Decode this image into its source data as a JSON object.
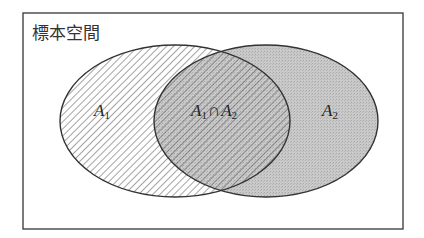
{
  "diagram": {
    "type": "venn",
    "sample_space_label": "標本空間",
    "sets": [
      {
        "name": "A",
        "subscript": "1",
        "fill": "hatched"
      },
      {
        "name": "A",
        "subscript": "2",
        "fill": "#c4c4c4"
      }
    ],
    "intersection": {
      "left": {
        "name": "A",
        "subscript": "1"
      },
      "operator": "∩",
      "right": {
        "name": "A",
        "subscript": "2"
      }
    },
    "colors": {
      "frame": "#444444",
      "outline": "#333333",
      "hatch": "#555555",
      "a2_fill": "#c4c4c4",
      "background": "#ffffff"
    }
  }
}
